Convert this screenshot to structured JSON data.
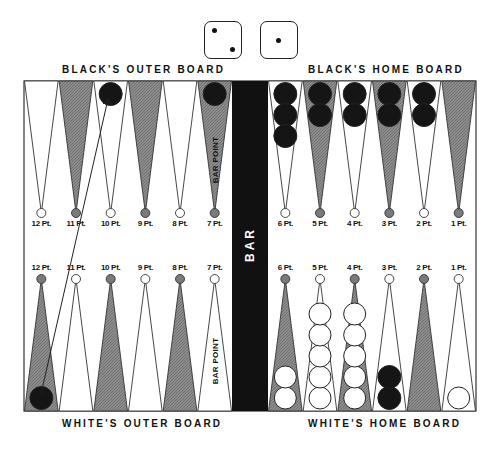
{
  "dice": [
    {
      "value": 2,
      "label": "die-left"
    },
    {
      "value": 1,
      "label": "die-right"
    }
  ],
  "board_labels": {
    "top_left": "BLACK'S OUTER BOARD",
    "top_right": "BLACK'S HOME BOARD",
    "bottom_left": "WHITE'S OUTER BOARD",
    "bottom_right": "WHITE'S HOME BOARD",
    "bar": "B A R",
    "bar_point_top": "BAR POINT",
    "bar_point_bottom": "BAR POINT"
  },
  "top_points": [
    {
      "label": "12 Pt.",
      "color": "white",
      "checkers": []
    },
    {
      "label": "11 Pt.",
      "color": "gray",
      "checkers": []
    },
    {
      "label": "10 Pt.",
      "color": "white",
      "checkers": [
        "black"
      ]
    },
    {
      "label": "9 Pt.",
      "color": "gray",
      "checkers": []
    },
    {
      "label": "8 Pt.",
      "color": "white",
      "checkers": []
    },
    {
      "label": "7 Pt.",
      "color": "gray",
      "checkers": [
        "black"
      ]
    },
    {
      "label": "6 Pt.",
      "color": "white",
      "checkers": [
        "black",
        "black",
        "black"
      ]
    },
    {
      "label": "5 Pt.",
      "color": "gray",
      "checkers": [
        "black",
        "black"
      ]
    },
    {
      "label": "4 Pt.",
      "color": "white",
      "checkers": [
        "black",
        "black"
      ]
    },
    {
      "label": "3 Pt.",
      "color": "gray",
      "checkers": [
        "black",
        "black"
      ]
    },
    {
      "label": "2 Pt.",
      "color": "white",
      "checkers": [
        "black",
        "black"
      ]
    },
    {
      "label": "1 Pt.",
      "color": "gray",
      "checkers": []
    }
  ],
  "bottom_points": [
    {
      "label": "12 Pt.",
      "color": "gray",
      "checkers": [
        "black"
      ]
    },
    {
      "label": "11 Pt.",
      "color": "white",
      "checkers": []
    },
    {
      "label": "10 Pt.",
      "color": "gray",
      "checkers": []
    },
    {
      "label": "9 Pt.",
      "color": "white",
      "checkers": []
    },
    {
      "label": "8 Pt.",
      "color": "gray",
      "checkers": []
    },
    {
      "label": "7 Pt.",
      "color": "white",
      "checkers": []
    },
    {
      "label": "6 Pt.",
      "color": "gray",
      "checkers": [
        "white",
        "white"
      ]
    },
    {
      "label": "5 Pt.",
      "color": "white",
      "checkers": [
        "white",
        "white",
        "white",
        "white",
        "white"
      ]
    },
    {
      "label": "4 Pt.",
      "color": "gray",
      "checkers": [
        "white",
        "white",
        "white",
        "white",
        "white"
      ]
    },
    {
      "label": "3 Pt.",
      "color": "white",
      "checkers": [
        "black",
        "black"
      ]
    },
    {
      "label": "2 Pt.",
      "color": "gray",
      "checkers": []
    },
    {
      "label": "1 Pt.",
      "color": "white",
      "checkers": [
        "white"
      ]
    }
  ],
  "move_arrow": {
    "from": "bottom 12 Pt.",
    "to": "top 10 Pt."
  },
  "colors": {
    "gray_point": "#8a8a8a",
    "white_point": "#ffffff",
    "bar": "#111111",
    "black_checker": "#151515",
    "white_checker": "#ffffff",
    "outline": "#222222"
  }
}
